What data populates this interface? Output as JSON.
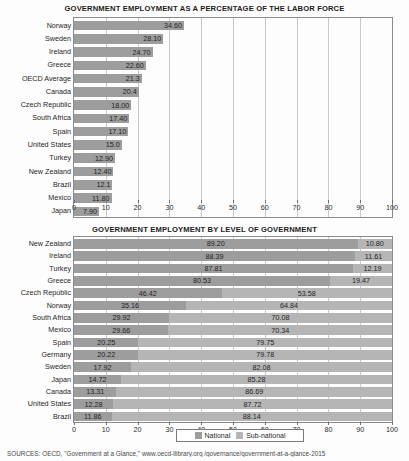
{
  "chart_data": [
    {
      "type": "bar",
      "title": "GOVERNMENT EMPLOYMENT AS A PERCENTAGE OF THE LABOR FORCE",
      "xlabel": "",
      "ylabel": "",
      "xlim": [
        0,
        100
      ],
      "xticks": [
        0,
        10,
        20,
        30,
        40,
        50,
        60,
        70,
        80,
        90,
        100
      ],
      "grid": true,
      "orientation": "horizontal",
      "legend": null,
      "categories": [
        "Norway",
        "Sweden",
        "Ireland",
        "Greece",
        "OECD Average",
        "Canada",
        "Czech Republic",
        "South Africa",
        "Spain",
        "United States",
        "Turkey",
        "New Zealand",
        "Brazil",
        "Mexico",
        "Japan"
      ],
      "values": [
        34.6,
        28.1,
        24.7,
        22.6,
        21.3,
        20.4,
        18.0,
        17.4,
        17.1,
        15.0,
        12.9,
        12.4,
        12.1,
        11.8,
        7.9
      ],
      "labels": [
        "34.60",
        "28.10",
        "24.70",
        "22.60",
        "21.3",
        "20.4",
        "18.00",
        "17.40",
        "17.10",
        "15.0",
        "12.90",
        "12.40",
        "12.1",
        "11.80",
        "7.90"
      ],
      "bar_color": "#9d9d9d"
    },
    {
      "type": "bar",
      "subtype": "stacked-100",
      "title": "GOVERNMENT EMPLOYMENT BY LEVEL OF GOVERNMENT",
      "xlabel": "",
      "ylabel": "",
      "xlim": [
        0,
        100
      ],
      "xticks": [
        0,
        10,
        20,
        30,
        40,
        50,
        60,
        70,
        80,
        90,
        100
      ],
      "grid": true,
      "orientation": "horizontal",
      "legend": {
        "position": "bottom",
        "entries": [
          "National",
          "Sub-national"
        ]
      },
      "categories": [
        "New Zealand",
        "Ireland",
        "Turkey",
        "Greece",
        "Czech Republic",
        "Norway",
        "South Africa",
        "Mexico",
        "Spain",
        "Germany",
        "Sweden",
        "Japan",
        "Canada",
        "United States",
        "Brazil"
      ],
      "series": [
        {
          "name": "National",
          "color": "#9d9d9d",
          "values": [
            89.2,
            88.39,
            87.81,
            80.53,
            46.42,
            35.16,
            29.92,
            29.66,
            20.25,
            20.22,
            17.92,
            14.72,
            13.31,
            12.28,
            11.86
          ],
          "labels": [
            "89.20",
            "88.39",
            "87.81",
            "80.53",
            "46.42",
            "35.16",
            "29.92",
            "29.66",
            "20.25",
            "20.22",
            "17.92",
            "14.72",
            "13.31",
            "12.28",
            "11.86"
          ]
        },
        {
          "name": "Sub-national",
          "color": "#b5b5b5",
          "values": [
            10.8,
            11.61,
            12.19,
            19.47,
            53.58,
            64.84,
            70.08,
            70.34,
            79.75,
            79.78,
            82.08,
            85.28,
            86.69,
            87.72,
            88.14
          ],
          "labels": [
            "10.80",
            "11.61",
            "12.19",
            "19.47",
            "53.58",
            "64.84",
            "70.08",
            "70.34",
            "79.75",
            "79.78",
            "82.08",
            "85.28",
            "86.69",
            "87.72",
            "88.14"
          ]
        }
      ]
    }
  ],
  "legend": {
    "national_label": "National",
    "subnational_label": "Sub-national"
  },
  "source": {
    "text": "SOURCES: OECD, \"Government at a Glance,\" www.oecd-ilibrary.org /governance/government-at-a-glance-2015"
  }
}
